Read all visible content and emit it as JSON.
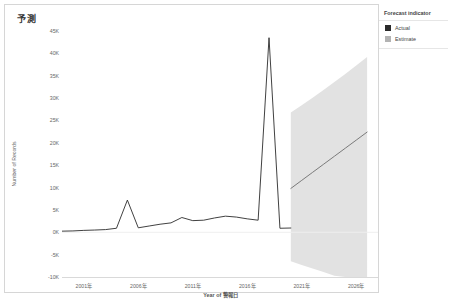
{
  "title": "予測",
  "legend": {
    "title": "Forecast indicator",
    "items": [
      {
        "label": "Actual",
        "color": "#2b2b2b"
      },
      {
        "label": "Estimate",
        "color": "#b3b3b3"
      }
    ]
  },
  "chart_data": {
    "type": "line",
    "title": "予測",
    "xlabel": "Year of 警報日",
    "ylabel": "Number of Records",
    "ylim": [
      -10000,
      45000
    ],
    "xlim": [
      1999,
      2028
    ],
    "grid": false,
    "legend_position": "right",
    "yticks": [
      45000,
      40000,
      35000,
      30000,
      25000,
      20000,
      15000,
      10000,
      5000,
      0,
      -5000,
      -10000
    ],
    "ytick_labels": [
      "45K",
      "40K",
      "35K",
      "30K",
      "25K",
      "20K",
      "15K",
      "10K",
      "5K",
      "0K",
      "-5K",
      "-10K"
    ],
    "xticks": [
      2001,
      2006,
      2011,
      2016,
      2021,
      2026
    ],
    "xtick_labels": [
      "2001年",
      "2006年",
      "2011年",
      "2016年",
      "2021年",
      "2026年"
    ],
    "series": [
      {
        "name": "Actual",
        "color": "#2b2b2b",
        "x": [
          1999,
          2000,
          2001,
          2002,
          2003,
          2004,
          2005,
          2006,
          2007,
          2008,
          2009,
          2010,
          2011,
          2012,
          2013,
          2014,
          2015,
          2016,
          2017,
          2018,
          2019,
          2020
        ],
        "values": [
          250,
          300,
          420,
          500,
          600,
          900,
          7200,
          1000,
          1400,
          1800,
          2100,
          3300,
          2600,
          2700,
          3200,
          3600,
          3400,
          3000,
          2700,
          43500,
          900,
          950
        ]
      },
      {
        "name": "Estimate",
        "color": "#6e6e6e",
        "x": [
          2020,
          2021,
          2022,
          2023,
          2024,
          2025,
          2026,
          2027
        ],
        "values": [
          9800,
          11600,
          13400,
          15200,
          17000,
          18800,
          20600,
          22400
        ],
        "ci_upper": [
          26800,
          28400,
          30100,
          31800,
          33600,
          35400,
          37300,
          39200
        ],
        "ci_lower": [
          -6500,
          -7300,
          -8100,
          -8900,
          -9700,
          -10500,
          -11400,
          -12300
        ],
        "band_color": "#e2e2e2"
      }
    ]
  }
}
